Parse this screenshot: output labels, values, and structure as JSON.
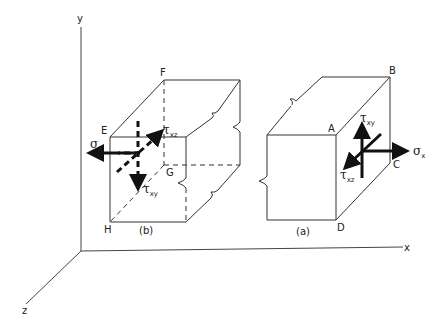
{
  "diagram": {
    "axes": {
      "x_label": "x",
      "y_label": "y",
      "z_label": "z"
    },
    "cube_b": {
      "caption": "(b)",
      "vertices": {
        "E": "E",
        "F": "F",
        "G": "G",
        "H": "H"
      },
      "stresses": {
        "sigma": {
          "symbol": "σ",
          "sub": "x"
        },
        "tau_xz": {
          "symbol": "τ",
          "sub": "xz"
        },
        "tau_xy": {
          "symbol": "τ",
          "sub": "xy"
        }
      }
    },
    "cube_a": {
      "caption": "(a)",
      "vertices": {
        "A": "A",
        "B": "B",
        "C": "C",
        "D": "D"
      },
      "stresses": {
        "sigma": {
          "symbol": "σ",
          "sub": "x"
        },
        "tau_xz": {
          "symbol": "τ",
          "sub": "xz"
        },
        "tau_xy": {
          "symbol": "τ",
          "sub": "xy"
        }
      }
    }
  }
}
